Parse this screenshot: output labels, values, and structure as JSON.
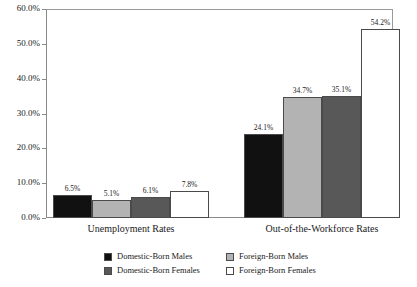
{
  "chart_data": {
    "type": "bar",
    "title": "",
    "xlabel": "",
    "ylabel": "",
    "ylim": [
      0,
      60
    ],
    "grid": false,
    "legend_position": "bottom",
    "categories": [
      "Unemployment Rates",
      "Out-of-the-Workforce Rates"
    ],
    "ytick_labels": [
      "0.0%",
      "10.0%",
      "20.0%",
      "30.0%",
      "40.0%",
      "50.0%",
      "60.0%"
    ],
    "ytick_values": [
      0,
      10,
      20,
      30,
      40,
      50,
      60
    ],
    "series": [
      {
        "name": "Domestic-Born Males",
        "color": "#111111",
        "values": [
          6.5,
          24.1
        ],
        "labels": [
          "6.5%",
          "24.1%"
        ]
      },
      {
        "name": "Foreign-Born Males",
        "color": "#b3b3b3",
        "values": [
          5.1,
          34.7
        ],
        "labels": [
          "5.1%",
          "34.7%"
        ]
      },
      {
        "name": "Domestic-Born Females",
        "color": "#585858",
        "values": [
          6.1,
          35.1
        ],
        "labels": [
          "6.1%",
          "35.1%"
        ]
      },
      {
        "name": "Foreign-Born Females",
        "color": "#ffffff",
        "values": [
          7.8,
          54.2
        ],
        "labels": [
          "7.8%",
          "54.2%"
        ]
      }
    ]
  },
  "legend": {
    "items": [
      {
        "label": "Domestic-Born Males",
        "color": "#111111"
      },
      {
        "label": "Domestic-Born Females",
        "color": "#585858"
      },
      {
        "label": "Foreign-Born Males",
        "color": "#b3b3b3"
      },
      {
        "label": "Foreign-Born Females",
        "color": "#ffffff"
      }
    ]
  }
}
